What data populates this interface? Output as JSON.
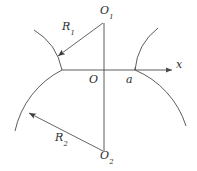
{
  "figure": {
    "kind": "geometry-diagram",
    "background_color": "#ffffff",
    "stroke_color": "#4a4a4a",
    "label_color": "#2b2b2b",
    "labels": {
      "center_upper": {
        "base": "O",
        "sub": "1"
      },
      "center_lower": {
        "base": "O",
        "sub": "2"
      },
      "origin": {
        "base": "O",
        "sub": ""
      },
      "point_a": {
        "base": "a",
        "sub": ""
      },
      "axis_x": {
        "base": "x",
        "sub": ""
      },
      "radius_upper": {
        "base": "R",
        "sub": "1"
      },
      "radius_lower": {
        "base": "R",
        "sub": "2"
      }
    },
    "geometry": {
      "origin_px": [
        104,
        70
      ],
      "center_upper_px": [
        104,
        22
      ],
      "center_lower_px": [
        104,
        152
      ],
      "point_a_px": [
        135,
        70
      ],
      "axis_arrow_end_px": [
        174,
        70
      ],
      "radius_upper_arrow_tip_px": [
        57,
        57
      ],
      "radius_lower_arrow_tip_px": [
        28,
        113
      ],
      "arc_upper_left_radius": 60,
      "arc_upper_right_radius": 60,
      "arc_lower_left_radius": 90,
      "arc_lower_right_radius": 90
    }
  }
}
